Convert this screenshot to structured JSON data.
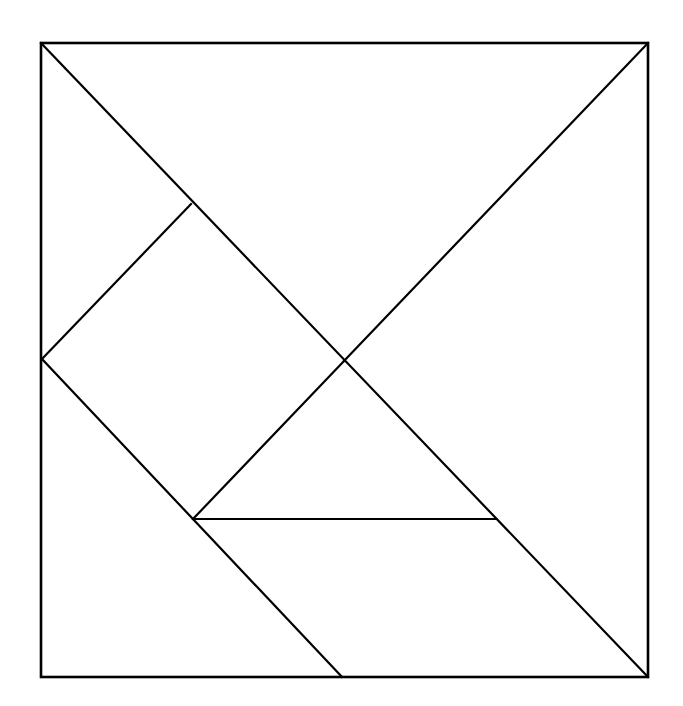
{
  "diagram": {
    "type": "tangram",
    "stroke_color": "#000000",
    "background": "#ffffff",
    "outer_square": {
      "x1": 41,
      "y1": 43,
      "x2": 648,
      "y2": 677
    },
    "vertices": {
      "top_left": [
        41,
        43
      ],
      "top_right": [
        648,
        43
      ],
      "bottom_right": [
        648,
        677
      ],
      "bottom_left": [
        41,
        677
      ],
      "center": [
        344,
        361
      ],
      "upper_left_notch": [
        191,
        204
      ],
      "left_mid": [
        42,
        359
      ],
      "inner_left": [
        193,
        519
      ],
      "inner_right": [
        496,
        519
      ],
      "bottom_mid": [
        342,
        677
      ]
    },
    "segments": [
      {
        "name": "main-diagonal",
        "from": [
          41,
          43
        ],
        "to": [
          648,
          677
        ]
      },
      {
        "name": "top-right-to-center",
        "from": [
          648,
          43
        ],
        "to": [
          344,
          361
        ]
      },
      {
        "name": "square-piece-upper-edge",
        "from": [
          191,
          204
        ],
        "to": [
          42,
          359
        ]
      },
      {
        "name": "left-mid-to-bottom",
        "from": [
          42,
          359
        ],
        "to": [
          342,
          677
        ]
      },
      {
        "name": "center-to-inner-left",
        "from": [
          344,
          361
        ],
        "to": [
          193,
          519
        ]
      },
      {
        "name": "small-triangle-base",
        "from": [
          193,
          519
        ],
        "to": [
          496,
          519
        ]
      }
    ]
  }
}
